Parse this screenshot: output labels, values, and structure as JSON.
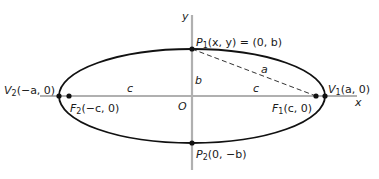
{
  "figure": {
    "type": "ellipse-diagram",
    "colors": {
      "axis": "#b0b0b0",
      "curve": "#111111",
      "point": "#111111",
      "dash": "#333333",
      "text": "#1a1a1a"
    },
    "geometry": {
      "center": [
        192,
        96
      ],
      "a_px": 133,
      "b_px": 47,
      "c_px": 123
    },
    "axes": {
      "x_label": "x",
      "y_label": "y",
      "origin_label": "O"
    },
    "points": {
      "P1": {
        "name": "P",
        "sub": "1",
        "text": "(x, y) = (0, b)"
      },
      "P2": {
        "name": "P",
        "sub": "2",
        "text": "(0, −b)"
      },
      "V1": {
        "name": "V",
        "sub": "1",
        "text": "(a, 0)"
      },
      "V2": {
        "name": "V",
        "sub": "2",
        "text": "(−a, 0)"
      },
      "F1": {
        "name": "F",
        "sub": "1",
        "text": "(c, 0)"
      },
      "F2": {
        "name": "F",
        "sub": "2",
        "text": "(−c, 0)"
      }
    },
    "segment_labels": {
      "a": "a",
      "b": "b",
      "c_left": "c",
      "c_right": "c"
    }
  }
}
